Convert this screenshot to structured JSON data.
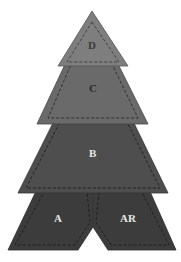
{
  "diagram": {
    "pieces": [
      {
        "id": "D",
        "label": "D",
        "fill": "#7e7e7e",
        "label_color": "#3a3a3a"
      },
      {
        "id": "C",
        "label": "C",
        "fill": "#6a6a6a",
        "label_color": "#2a2a2a"
      },
      {
        "id": "B",
        "label": "B",
        "fill": "#4e4e4e",
        "label_color": "#e6e6e6"
      },
      {
        "id": "A",
        "label": "A",
        "fill": "#3c3c3c",
        "label_color": "#e6e6e6"
      },
      {
        "id": "AR",
        "label": "AR",
        "fill": "#3c3c3c",
        "label_color": "#e6e6e6"
      }
    ],
    "seam_line_style": "dashed",
    "seam_color": "#222222",
    "background": "#ffffff"
  }
}
